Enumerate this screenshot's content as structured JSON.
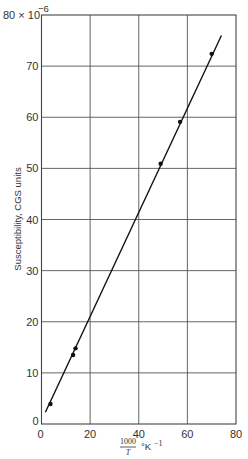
{
  "chart_data": {
    "type": "scatter",
    "title": "",
    "xlabel": "1000/T °K⁻¹",
    "xlabel_numerator": "1000",
    "xlabel_denominator": "T",
    "xlabel_unit": "°K",
    "xlabel_exp": "−1",
    "ylabel": "Susceptibility, CGS units",
    "y_top_label": "80 × 10",
    "y_top_exp": "−6",
    "xlim": [
      0,
      80
    ],
    "ylim": [
      0,
      80
    ],
    "grid": true,
    "xticks": [
      0,
      20,
      40,
      60,
      80
    ],
    "yticks": [
      0,
      10,
      20,
      30,
      40,
      50,
      60,
      70,
      80
    ],
    "xtick_labels": [
      "0",
      "20",
      "40",
      "60",
      "80"
    ],
    "ytick_labels": [
      "0",
      "10",
      "20",
      "30",
      "40",
      "50",
      "60",
      "70",
      "80 × 10⁻⁶"
    ],
    "series": [
      {
        "name": "measured",
        "marker": "dot",
        "x": [
          3.7,
          13,
          14,
          49,
          57,
          70
        ],
        "y": [
          3.9,
          13.5,
          14.8,
          50.9,
          59.1,
          72.4
        ]
      },
      {
        "name": "fit",
        "style": "line",
        "x": [
          1.6,
          74
        ],
        "y": [
          2.3,
          76
        ]
      }
    ]
  }
}
